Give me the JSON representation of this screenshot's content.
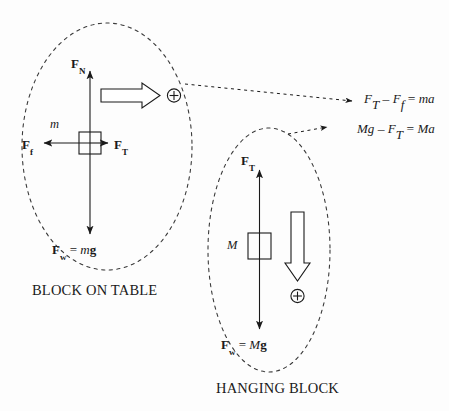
{
  "figure": {
    "background_color": "#fdfdfd",
    "stroke_color": "#1a1a1a",
    "title": ""
  },
  "systems": [
    {
      "id": "block-on-table",
      "caption": "BLOCK ON TABLE",
      "mass_label": "m",
      "forces": [
        {
          "id": "normal",
          "symbol": "F",
          "subscript": "N",
          "label": "F_N",
          "direction": "up"
        },
        {
          "id": "friction",
          "symbol": "F",
          "subscript": "f",
          "label": "F_f",
          "direction": "left"
        },
        {
          "id": "tension",
          "symbol": "F",
          "subscript": "T",
          "label": "F_T",
          "direction": "right"
        },
        {
          "id": "weight",
          "symbol": "F",
          "subscript": "w",
          "label": "F_w = mg",
          "direction": "down",
          "equals": "=",
          "mass": "m",
          "gravity": "g"
        }
      ],
      "positive_direction": {
        "arrow": "right",
        "marker": "plus-circle",
        "marker_glyph": "+"
      }
    },
    {
      "id": "hanging-block",
      "caption": "HANGING BLOCK",
      "mass_label": "M",
      "forces": [
        {
          "id": "tension",
          "symbol": "F",
          "subscript": "T",
          "label": "F_T",
          "direction": "up"
        },
        {
          "id": "weight",
          "symbol": "F",
          "subscript": "w",
          "label": "F_w = Mg",
          "direction": "down",
          "equals": "=",
          "mass": "M",
          "gravity": "g"
        }
      ],
      "positive_direction": {
        "arrow": "down",
        "marker": "plus-circle",
        "marker_glyph": "+"
      }
    }
  ],
  "equations": [
    {
      "id": "eq-block-on-table",
      "text": "F_T - F_f = ma",
      "parts": {
        "t1": "F",
        "s1": "T",
        "op1": "–",
        "t2": "F",
        "s2": "f",
        "eq": "=",
        "rhs": "ma"
      }
    },
    {
      "id": "eq-hanging-block",
      "text": "Mg - F_T = Ma",
      "parts": {
        "lhs": "Mg",
        "op1": "–",
        "t2": "F",
        "s2": "T",
        "eq": "=",
        "rhs": "Ma"
      }
    }
  ],
  "leaders": [
    {
      "id": "leader-block-on-table",
      "from": "block-on-table-oval",
      "to": "eq-block-on-table"
    },
    {
      "id": "leader-hanging-block",
      "from": "hanging-block-oval",
      "to": "eq-hanging-block"
    }
  ]
}
